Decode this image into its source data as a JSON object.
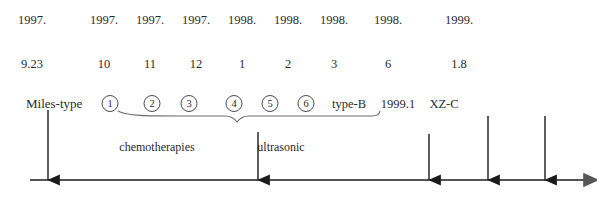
{
  "diagram": {
    "axis": {
      "color": "#555555",
      "start_x": 30,
      "end_x": 585,
      "y": 180
    },
    "years_row": {
      "label": "year-labels",
      "items": [
        {
          "text": "1997.",
          "x": 32
        },
        {
          "text": "1997.",
          "x": 104
        },
        {
          "text": "1997.",
          "x": 150
        },
        {
          "text": "1997.",
          "x": 196
        },
        {
          "text": "1998.",
          "x": 242
        },
        {
          "text": "1998.",
          "x": 288
        },
        {
          "text": "1998.",
          "x": 334
        },
        {
          "text": "1998.",
          "x": 388
        },
        {
          "text": "1999.",
          "x": 459
        }
      ]
    },
    "dates_row": {
      "label": "date-labels",
      "items": [
        {
          "text": "9.23",
          "x": 32
        },
        {
          "text": "10",
          "x": 104
        },
        {
          "text": "11",
          "x": 150
        },
        {
          "text": "12",
          "x": 196
        },
        {
          "text": "1",
          "x": 242
        },
        {
          "text": "2",
          "x": 288
        },
        {
          "text": "3",
          "x": 334
        },
        {
          "text": "6",
          "x": 388
        },
        {
          "text": "1.8",
          "x": 459
        }
      ]
    },
    "events_row": {
      "lead_label": {
        "text": "Miles-type",
        "x": 26
      },
      "circled_numbers": [
        {
          "text": "①",
          "value": "1",
          "x": 110
        },
        {
          "text": "②",
          "value": "2",
          "x": 152
        },
        {
          "text": "③",
          "value": "3",
          "x": 189
        },
        {
          "text": "④",
          "value": "4",
          "x": 234
        },
        {
          "text": "⑤",
          "value": "5",
          "x": 270
        },
        {
          "text": "⑥",
          "value": "6",
          "x": 306
        }
      ],
      "trailing_labels": [
        {
          "text": "type-B",
          "x": 349
        },
        {
          "text": "1999.1",
          "x": 398
        },
        {
          "text": "XZ-C",
          "x": 444
        }
      ]
    },
    "notes_row": {
      "items": [
        {
          "text": "chemotherapies",
          "x": 157
        },
        {
          "text": "ultrasonic",
          "x": 281
        }
      ]
    },
    "down_arrows": [
      {
        "name": "arrow-miles-type",
        "x": 48,
        "y_top": 110
      },
      {
        "name": "arrow-ultrasonic",
        "x": 258,
        "y_top": 132
      },
      {
        "name": "arrow-type-b",
        "x": 429,
        "y_top": 134
      },
      {
        "name": "arrow-1999",
        "x": 488,
        "y_top": 116
      },
      {
        "name": "arrow-xz-c",
        "x": 545,
        "y_top": 116
      }
    ],
    "brace": {
      "name": "chemotherapy-brace",
      "left_x": 118,
      "right_x": 378,
      "y": 114,
      "tip_x": 237,
      "tip_y": 122,
      "color": "#6a6a6a"
    }
  }
}
